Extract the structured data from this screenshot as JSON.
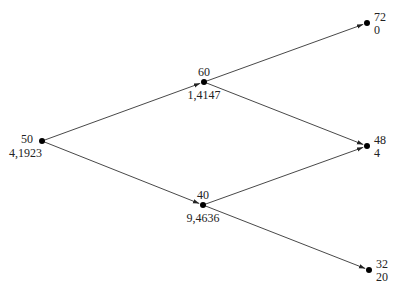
{
  "diagram": {
    "type": "binomial-tree",
    "colors": {
      "line": "#333333",
      "node": "#000000",
      "text": "#222222",
      "background": "#ffffff"
    },
    "nodes": [
      {
        "id": "root",
        "x": 42,
        "y": 141,
        "top": "50",
        "bottom": "4,1923",
        "label_side": "left"
      },
      {
        "id": "up",
        "x": 204,
        "y": 82,
        "top": "60",
        "bottom": "1,4147",
        "label_side": "center"
      },
      {
        "id": "down",
        "x": 203,
        "y": 205,
        "top": "40",
        "bottom": "9,4636",
        "label_side": "center"
      },
      {
        "id": "uu",
        "x": 367,
        "y": 23,
        "top": "72",
        "bottom": "0",
        "label_side": "right"
      },
      {
        "id": "ud",
        "x": 367,
        "y": 146,
        "top": "48",
        "bottom": "4",
        "label_side": "right"
      },
      {
        "id": "dd",
        "x": 369,
        "y": 270,
        "top": "32",
        "bottom": "20",
        "label_side": "right"
      }
    ],
    "edges": [
      {
        "from": "root",
        "to": "up"
      },
      {
        "from": "root",
        "to": "down"
      },
      {
        "from": "up",
        "to": "uu"
      },
      {
        "from": "up",
        "to": "ud"
      },
      {
        "from": "down",
        "to": "ud"
      },
      {
        "from": "down",
        "to": "dd"
      }
    ]
  }
}
